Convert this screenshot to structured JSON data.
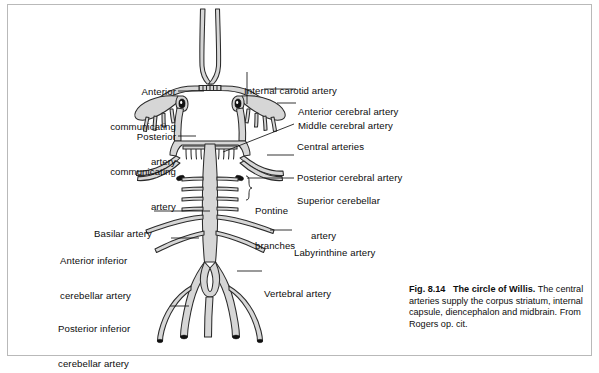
{
  "figure": {
    "title_prefix": "Fig. 8.14",
    "title_bold": "The circle of Willis.",
    "caption_body": "The central arteries supply the corpus striatum, internal capsule, diencephalon and midbrain. From Rogers op. cit.",
    "diagram_type": "anatomical-line-diagram",
    "colors": {
      "vessel_fill": "#d6d6d6",
      "vessel_stroke": "#2b2b2b",
      "vessel_lumen": "#111111",
      "page_background": "#ffffff",
      "frame_border": "#b9b9b9",
      "text": "#0d0d0d",
      "leader_line": "#111111"
    }
  },
  "labels": {
    "left": [
      {
        "id": "anterior-communicating-artery",
        "lines": [
          "Anterior",
          "communicating",
          "artery"
        ],
        "align": "right"
      },
      {
        "id": "posterior-communicating-artery",
        "lines": [
          "Posterior",
          "communicating",
          "artery"
        ],
        "align": "right"
      },
      {
        "id": "basilar-artery",
        "lines": [
          "Basilar artery"
        ],
        "align": "right"
      },
      {
        "id": "anterior-inferior-cerebellar-artery",
        "lines": [
          "Anterior inferior",
          "cerebellar artery"
        ],
        "align": "left"
      },
      {
        "id": "posterior-inferior-cerebellar-artery",
        "lines": [
          "Posterior inferior",
          "cerebellar artery"
        ],
        "align": "left"
      }
    ],
    "right": [
      {
        "id": "internal-carotid-artery",
        "lines": [
          "Internal carotid artery"
        ],
        "align": "left"
      },
      {
        "id": "anterior-cerebral-artery",
        "lines": [
          "Anterior cerebral artery"
        ],
        "align": "left"
      },
      {
        "id": "middle-cerebral-artery",
        "lines": [
          "Middle cerebral artery"
        ],
        "align": "left"
      },
      {
        "id": "central-arteries",
        "lines": [
          "Central arteries"
        ],
        "align": "left"
      },
      {
        "id": "posterior-cerebral-artery",
        "lines": [
          "Posterior cerebral artery"
        ],
        "align": "left"
      },
      {
        "id": "superior-cerebellar-artery",
        "lines": [
          "Superior cerebellar",
          "artery"
        ],
        "align": "left"
      },
      {
        "id": "pontine-branches",
        "lines": [
          "Pontine",
          "branches"
        ],
        "align": "left"
      },
      {
        "id": "labyrinthine-artery",
        "lines": [
          "Labyrinthine artery"
        ],
        "align": "left"
      },
      {
        "id": "vertebral-artery",
        "lines": [
          "Vertebral artery"
        ],
        "align": "left"
      }
    ]
  },
  "label_text": {
    "anterior_communicating_1": "Anterior",
    "anterior_communicating_2": "communicating",
    "anterior_communicating_3": "artery",
    "posterior_communicating_1": "Posterior",
    "posterior_communicating_2": "communicating",
    "posterior_communicating_3": "artery",
    "basilar": "Basilar artery",
    "aica_1": "Anterior inferior",
    "aica_2": "cerebellar artery",
    "pica_1": "Posterior inferior",
    "pica_2": "cerebellar artery",
    "internal_carotid": "Internal carotid artery",
    "anterior_cerebral": "Anterior cerebral artery",
    "middle_cerebral": "Middle cerebral artery",
    "central_arteries": "Central arteries",
    "posterior_cerebral": "Posterior cerebral artery",
    "superior_cerebellar_1": "Superior cerebellar",
    "superior_cerebellar_2": "artery",
    "pontine_1": "Pontine",
    "pontine_2": "branches",
    "labyrinthine": "Labyrinthine artery",
    "vertebral": "Vertebral artery"
  }
}
